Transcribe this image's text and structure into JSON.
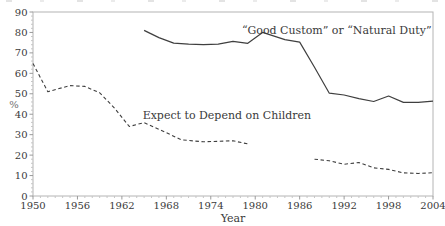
{
  "chart_data": {
    "type": "line",
    "title": "",
    "xlabel": "Year",
    "ylabel": "%",
    "xlim": [
      1950,
      2004
    ],
    "ylim": [
      0,
      90
    ],
    "x_ticks": [
      1950,
      1956,
      1962,
      1968,
      1974,
      1980,
      1986,
      1992,
      1998,
      2004
    ],
    "y_ticks": [
      0,
      10,
      20,
      30,
      40,
      50,
      60,
      70,
      80,
      90
    ],
    "x_minor_tick_step_years": 1,
    "y_minor_tick_step": 2,
    "grid": false,
    "legend_position": "inline-annotations",
    "colors": {
      "line": "#3f3f3f",
      "frame": "#b4b4b4",
      "tick": "#9a9a9a",
      "minor_tick": "#c6c6c6",
      "text": "#3a3a3a",
      "percent_label": "#6f6f6f"
    },
    "series": [
      {
        "name": "“Good Custom” or “Natural Duty”",
        "style": "solid",
        "segments": [
          [
            [
              1965,
              81
            ],
            [
              1967,
              77.5
            ],
            [
              1969,
              74.8
            ],
            [
              1971,
              74.3
            ],
            [
              1973,
              74
            ],
            [
              1975,
              74.3
            ],
            [
              1977,
              75.6
            ],
            [
              1979,
              74.7
            ],
            [
              1981,
              80
            ],
            [
              1984,
              76.5
            ],
            [
              1986,
              75.3
            ],
            [
              1988,
              63
            ],
            [
              1990,
              50.3
            ],
            [
              1992,
              49.4
            ],
            [
              1994,
              47.6
            ],
            [
              1996,
              46.2
            ],
            [
              1998,
              48.9
            ],
            [
              2000,
              45.8
            ],
            [
              2002,
              45.8
            ],
            [
              2004,
              46.4
            ]
          ]
        ]
      },
      {
        "name": "Expect to Depend on Children",
        "style": "dashed",
        "segments": [
          [
            [
              1950,
              64.8
            ],
            [
              1952,
              51
            ],
            [
              1955,
              54
            ],
            [
              1957,
              53.6
            ],
            [
              1959,
              50.5
            ],
            [
              1961,
              43
            ],
            [
              1963,
              34
            ],
            [
              1965,
              35.9
            ],
            [
              1968,
              31
            ],
            [
              1970,
              27.5
            ],
            [
              1973,
              26.5
            ],
            [
              1977,
              27
            ],
            [
              1979,
              25.5
            ]
          ],
          [
            [
              1988,
              18
            ],
            [
              1990,
              17.2
            ],
            [
              1992,
              15.5
            ],
            [
              1994,
              16.4
            ],
            [
              1996,
              13.8
            ],
            [
              1998,
              13
            ],
            [
              2000,
              11.3
            ],
            [
              2002,
              11
            ],
            [
              2004,
              11.4
            ]
          ]
        ]
      }
    ],
    "annotations": [
      {
        "text": "“Good Custom” or “Natural Duty”",
        "x": 2003.8,
        "y": 79.3,
        "anchor": "end"
      },
      {
        "text": "Expect to Depend on Children",
        "x": 1964.8,
        "y": 37.6,
        "anchor": "start"
      }
    ]
  }
}
